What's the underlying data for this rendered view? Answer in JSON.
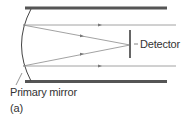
{
  "diagram": {
    "labels": {
      "detector": "Detector",
      "primary_mirror": "Primary mirror",
      "panel": "(a)"
    },
    "colors": {
      "tube_wall": "#555555",
      "ray": "#8a8a8a",
      "mirror": "#444444",
      "detector": "#666666",
      "text": "#333333"
    }
  }
}
